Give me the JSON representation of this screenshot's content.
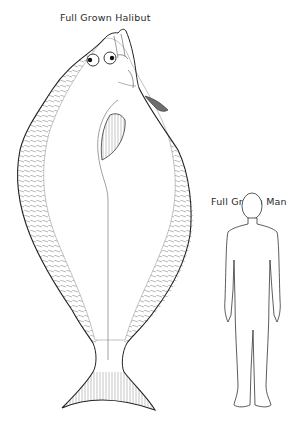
{
  "halibut": {
    "title": "Full Grown Halibut"
  },
  "man": {
    "title": "Full Grown Man"
  },
  "colors": {
    "outline": "#222222",
    "hatch": "#8a8a8a",
    "fin_shade": "#6e6e6e",
    "background": "#ffffff"
  }
}
